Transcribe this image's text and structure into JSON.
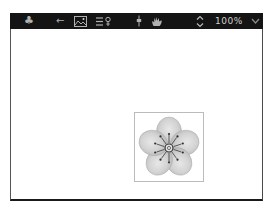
{
  "toolbar": {
    "zoom_level": "100%",
    "icons": [
      "club-icon",
      "back-arrow-icon",
      "image-icon",
      "list-tool-icon",
      "slider-icon",
      "hand-pan-icon",
      "zoom-stepper-icon",
      "dropdown-chevron-icon"
    ]
  },
  "glyphs": {
    "club": "♣",
    "back_arrow": "←"
  },
  "canvas": {
    "image_description": "grayscale five-petal blossom flower in a thin gray frame"
  },
  "colors": {
    "toolbar_bg": "#141414",
    "icon": "#b0b0b0",
    "zoom_text": "#cfcfcf",
    "canvas_border": "#555555",
    "canvas_bottom_border": "#1a1a1a",
    "image_frame": "#bbbbbb",
    "petal": "#cccccc",
    "stamen": "#3a3a3a"
  }
}
